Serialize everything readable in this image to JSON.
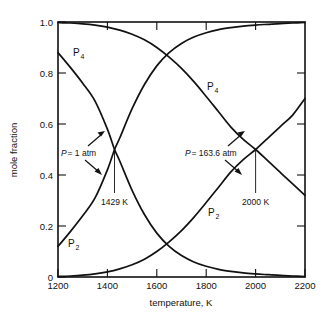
{
  "chart_data": {
    "type": "line",
    "title": "",
    "xlabel": "temperature, K",
    "ylabel": "mole fraction",
    "xlim": [
      1200,
      2200
    ],
    "ylim": [
      0,
      1.0
    ],
    "xticks": [
      1200,
      1400,
      1600,
      1800,
      2000,
      2200
    ],
    "xtick_labels": [
      "1200",
      "1400",
      "1600",
      "1800",
      "2000",
      "2200"
    ],
    "yticks": [
      0,
      0.2,
      0.4,
      0.6,
      0.8,
      1.0
    ],
    "ytick_labels": [
      "0",
      "0.2",
      "0.4",
      "0.6",
      "0.8",
      "1.0"
    ],
    "grid": false,
    "legend_position": "none",
    "frame": "box",
    "tick_direction": "in",
    "series": [
      {
        "name": "P4 at 1 atm",
        "label": "P",
        "label_sub": "4",
        "pressure_atm": 1,
        "x": [
          1200,
          1250,
          1300,
          1350,
          1400,
          1429,
          1450,
          1500,
          1550,
          1600,
          1650,
          1700,
          1750,
          1800,
          1850,
          1900,
          1950,
          2000,
          2050,
          2100,
          2150,
          2200
        ],
        "y": [
          0.88,
          0.822,
          0.76,
          0.69,
          0.58,
          0.5,
          0.455,
          0.34,
          0.245,
          0.172,
          0.12,
          0.084,
          0.059,
          0.042,
          0.03,
          0.022,
          0.016,
          0.012,
          0.009,
          0.006,
          0.004,
          0.002
        ]
      },
      {
        "name": "P2 at 1 atm",
        "label": "P",
        "label_sub": "2",
        "pressure_atm": 1,
        "x": [
          1200,
          1250,
          1300,
          1350,
          1400,
          1429,
          1450,
          1500,
          1550,
          1600,
          1650,
          1700,
          1750,
          1800,
          1850,
          1900,
          1950,
          2000,
          2050,
          2100,
          2150,
          2200
        ],
        "y": [
          0.12,
          0.178,
          0.24,
          0.31,
          0.42,
          0.5,
          0.545,
          0.66,
          0.755,
          0.828,
          0.88,
          0.916,
          0.941,
          0.958,
          0.97,
          0.978,
          0.984,
          0.988,
          0.991,
          0.994,
          0.996,
          0.998
        ]
      },
      {
        "name": "P4 at 163.6 atm",
        "label": "P",
        "label_sub": "4",
        "pressure_atm": 163.6,
        "x": [
          1200,
          1250,
          1300,
          1350,
          1400,
          1450,
          1500,
          1550,
          1600,
          1650,
          1700,
          1750,
          1800,
          1850,
          1900,
          1950,
          2000,
          2050,
          2100,
          2150,
          2200
        ],
        "y": [
          0.998,
          0.996,
          0.993,
          0.988,
          0.98,
          0.968,
          0.952,
          0.93,
          0.9,
          0.862,
          0.818,
          0.766,
          0.708,
          0.648,
          0.588,
          0.54,
          0.5,
          0.455,
          0.41,
          0.365,
          0.32
        ]
      },
      {
        "name": "P2 at 163.6 atm",
        "label": "P",
        "label_sub": "2",
        "pressure_atm": 163.6,
        "x": [
          1200,
          1250,
          1300,
          1350,
          1400,
          1450,
          1500,
          1550,
          1600,
          1650,
          1700,
          1750,
          1800,
          1850,
          1900,
          1950,
          2000,
          2050,
          2100,
          2150,
          2200
        ],
        "y": [
          0.002,
          0.004,
          0.007,
          0.012,
          0.02,
          0.032,
          0.048,
          0.07,
          0.1,
          0.138,
          0.182,
          0.234,
          0.292,
          0.352,
          0.412,
          0.46,
          0.5,
          0.545,
          0.59,
          0.635,
          0.7
        ]
      }
    ],
    "annotations": [
      {
        "name": "pressure-1-atm",
        "text_italic": "P",
        "text": " = 1 atm",
        "full_text": "P = 1 atm",
        "points_to_x": 1429,
        "points_to_y": 0.5
      },
      {
        "name": "pressure-163-atm",
        "text_italic": "P",
        "text": " = 163.6 atm",
        "full_text": "P = 163.6 atm",
        "points_to_x": 2000,
        "points_to_y": 0.5
      },
      {
        "name": "crossing-temperature-left",
        "full_text": "1429 K",
        "x": 1429,
        "y": 0.5
      },
      {
        "name": "crossing-temperature-right",
        "full_text": "2000 K",
        "x": 2000,
        "y": 0.5
      }
    ],
    "curve_labels": [
      {
        "name": "p4-label-left",
        "text": "P",
        "sub": "4"
      },
      {
        "name": "p4-label-right",
        "text": "P",
        "sub": "4"
      },
      {
        "name": "p2-label-left",
        "text": "P",
        "sub": "2"
      },
      {
        "name": "p2-label-right",
        "text": "P",
        "sub": "2"
      }
    ],
    "colors": {
      "curve": "#111111",
      "axis": "#111111",
      "background": "#ffffff"
    }
  }
}
